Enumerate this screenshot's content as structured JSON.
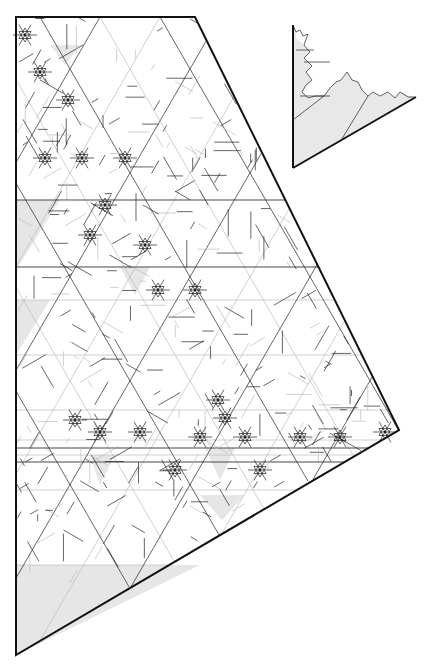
{
  "figure": {
    "colors": {
      "background": "#ffffff",
      "line": "#222222",
      "outline": "#111111",
      "shading": "#e6e6e6",
      "faint": "#bbbbbb"
    }
  }
}
